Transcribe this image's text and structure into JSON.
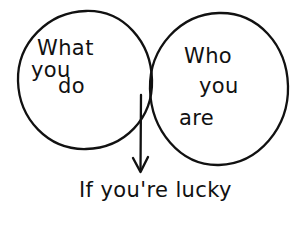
{
  "diagram": {
    "type": "venn-diagram",
    "title_text": "",
    "background_color": "#ffffff",
    "stroke_color": "#111111",
    "left_circle": {
      "name": "what-you-do",
      "lines": [
        "What",
        "you",
        "do"
      ]
    },
    "right_circle": {
      "name": "who-you-are",
      "lines": [
        "Who",
        "you",
        "are"
      ]
    },
    "intersection": {
      "name": "overlap-lens",
      "annotation": "If you're lucky",
      "arrow": "down-arrow"
    }
  }
}
